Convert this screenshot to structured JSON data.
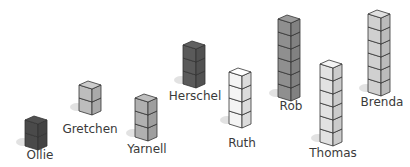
{
  "towers": [
    {
      "name": "Ollie",
      "cubes": 2,
      "color": "#4a4a4a",
      "x": 25,
      "base_y": 146,
      "label_y": 148,
      "label_x": 40
    },
    {
      "name": "Gretchen",
      "cubes": 2,
      "color": "#bdbdbd",
      "x": 79,
      "base_y": 111,
      "label_y": 122,
      "label_x": 90
    },
    {
      "name": "Yarnell",
      "cubes": 3,
      "color": "#b0b0b0",
      "x": 135,
      "base_y": 137,
      "label_y": 140,
      "label_x": 147
    },
    {
      "name": "Herschel",
      "cubes": 3,
      "color": "#5a5a5a",
      "x": 183,
      "base_y": 84,
      "label_y": 89,
      "label_x": 195
    },
    {
      "name": "Ruth",
      "cubes": 4,
      "color": "#f4f4f4",
      "x": 229,
      "base_y": 124,
      "label_y": 135,
      "label_x": 241
    },
    {
      "name": "Rob",
      "cubes": 6,
      "color": "#8f8f8f",
      "x": 278,
      "base_y": 97,
      "label_y": 101,
      "label_x": 290
    },
    {
      "name": "Thomas",
      "cubes": 6,
      "color": "#e2e2e2",
      "x": 320,
      "base_y": 142,
      "label_y": 145,
      "label_x": 332
    },
    {
      "name": "Brenda",
      "cubes": 6,
      "color": "#d0d0d0",
      "x": 368,
      "base_y": 92,
      "label_y": 97,
      "label_x": 382
    }
  ],
  "labels": {
    "ollie": "Ollie",
    "gretchen": "Gretchen",
    "yarnell": "Yarnell",
    "herschel": "Herschel",
    "ruth": "Ruth",
    "rob": "Rob",
    "thomas": "Thomas",
    "brenda": "Brenda"
  }
}
